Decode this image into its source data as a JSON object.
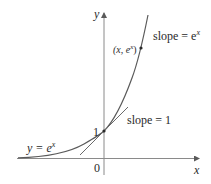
{
  "diagram": {
    "type": "function-graph",
    "function": "y = e^x",
    "axes": {
      "x_label": "x",
      "y_label": "y",
      "origin_label": "0",
      "y_intercept_label": "1"
    },
    "labels": {
      "curve_label_prefix": "y = e",
      "curve_label_exp": "x",
      "point_label_open": "(x, e",
      "point_label_exp": "x",
      "point_label_close": ")",
      "top_slope_prefix": "slope = e",
      "top_slope_exp": "x",
      "bottom_slope": "slope = 1"
    },
    "points": [
      {
        "name": "y-intercept",
        "coords": "(0, 1)"
      },
      {
        "name": "general-point",
        "coords": "(x, e^x)"
      }
    ],
    "colors": {
      "curve": "#5a5a5a",
      "axes": "#8a8a8a",
      "text": "#2a2a2a"
    }
  }
}
